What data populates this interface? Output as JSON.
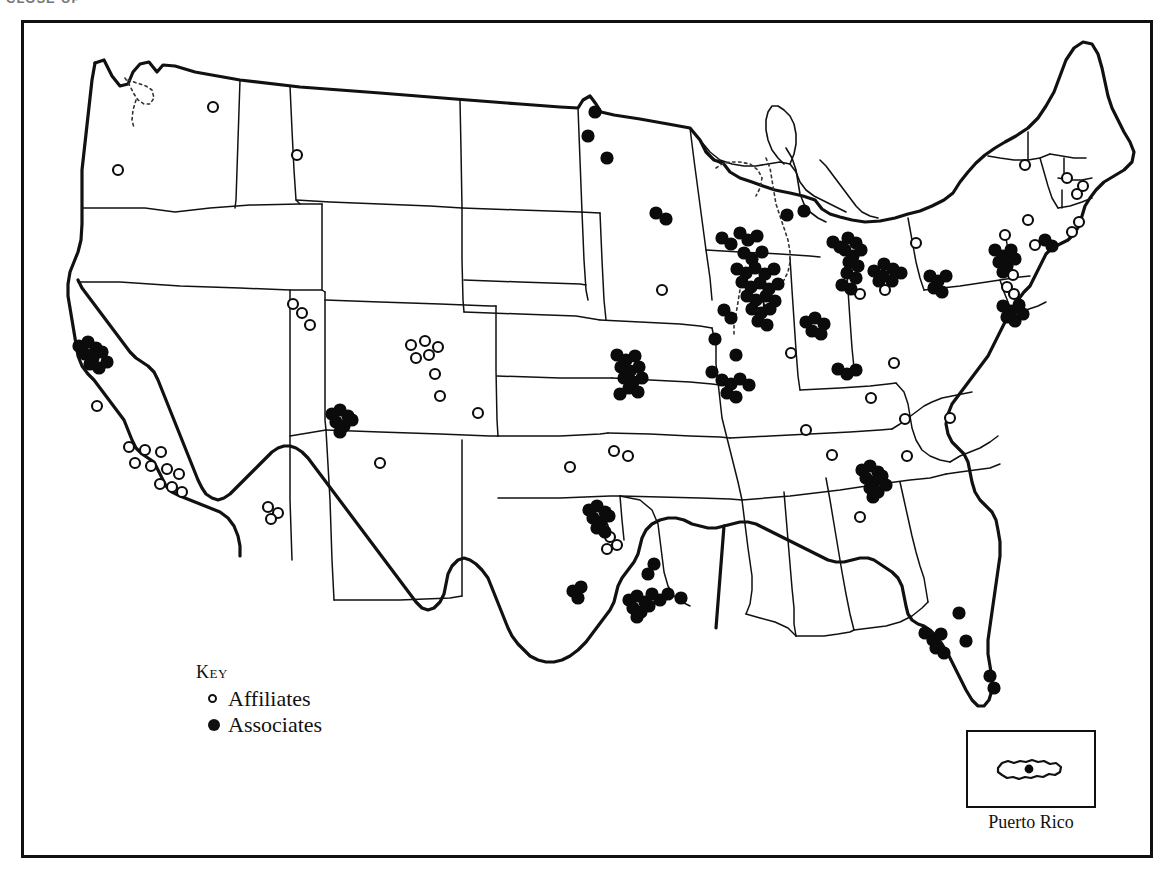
{
  "page": {
    "clipped_header_text": "CLOSE-UP",
    "background_color": "#ffffff",
    "ink_color": "#0b0b0b",
    "width": 1174,
    "height": 888
  },
  "key": {
    "title": "Key",
    "entries": [
      {
        "symbol": "open-circle",
        "label": "Affiliates"
      },
      {
        "symbol": "filled-circle",
        "label": "Associates"
      }
    ]
  },
  "inset": {
    "label": "Puerto Rico",
    "marker_symbol": "filled-circle"
  },
  "chart_data": {
    "type": "scatter",
    "title": "Key",
    "subtitle": "Distribution of Affiliates and Associates across the United States and Puerto Rico",
    "xlabel": "",
    "ylabel": "",
    "projection": "contiguous-united-states-outline",
    "grid": false,
    "legend_position": "lower-left",
    "series": [
      {
        "name": "Affiliates",
        "symbol": "open-circle",
        "color": "#ffffff",
        "stroke": "#0b0b0b",
        "count": 62,
        "points": [
          [
            213,
            107
          ],
          [
            297,
            155
          ],
          [
            118,
            170
          ],
          [
            293,
            304
          ],
          [
            302,
            313
          ],
          [
            310,
            325
          ],
          [
            411,
            345
          ],
          [
            425,
            341
          ],
          [
            438,
            347
          ],
          [
            416,
            358
          ],
          [
            429,
            355
          ],
          [
            435,
            374
          ],
          [
            440,
            396
          ],
          [
            380,
            463
          ],
          [
            268,
            507
          ],
          [
            278,
            513
          ],
          [
            271,
            519
          ],
          [
            478,
            413
          ],
          [
            570,
            467
          ],
          [
            614,
            451
          ],
          [
            628,
            456
          ],
          [
            97,
            406
          ],
          [
            129,
            447
          ],
          [
            145,
            450
          ],
          [
            161,
            452
          ],
          [
            135,
            463
          ],
          [
            151,
            466
          ],
          [
            167,
            469
          ],
          [
            179,
            474
          ],
          [
            160,
            484
          ],
          [
            172,
            487
          ],
          [
            182,
            492
          ],
          [
            662,
            290
          ],
          [
            759,
            305
          ],
          [
            791,
            353
          ],
          [
            860,
            294
          ],
          [
            885,
            290
          ],
          [
            894,
            363
          ],
          [
            871,
            398
          ],
          [
            806,
            430
          ],
          [
            832,
            455
          ],
          [
            860,
            517
          ],
          [
            905,
            419
          ],
          [
            907,
            456
          ],
          [
            950,
            418
          ],
          [
            916,
            243
          ],
          [
            1025,
            165
          ],
          [
            1028,
            220
          ],
          [
            1035,
            245
          ],
          [
            1005,
            235
          ],
          [
            1013,
            275
          ],
          [
            1007,
            287
          ],
          [
            1014,
            294
          ],
          [
            1067,
            178
          ],
          [
            1077,
            194
          ],
          [
            1083,
            186
          ],
          [
            1072,
            232
          ],
          [
            1079,
            222
          ],
          [
            603,
            527
          ],
          [
            610,
            537
          ],
          [
            617,
            545
          ],
          [
            607,
            549
          ]
        ]
      },
      {
        "name": "Associates",
        "symbol": "filled-circle",
        "color": "#0b0b0b",
        "count": 168,
        "points": [
          [
            595,
            112
          ],
          [
            588,
            136
          ],
          [
            607,
            158
          ],
          [
            656,
            213
          ],
          [
            666,
            219
          ],
          [
            722,
            238
          ],
          [
            731,
            244
          ],
          [
            740,
            233
          ],
          [
            748,
            240
          ],
          [
            757,
            236
          ],
          [
            744,
            253
          ],
          [
            752,
            259
          ],
          [
            762,
            252
          ],
          [
            737,
            269
          ],
          [
            746,
            273
          ],
          [
            755,
            268
          ],
          [
            765,
            274
          ],
          [
            774,
            269
          ],
          [
            742,
            282
          ],
          [
            751,
            287
          ],
          [
            760,
            283
          ],
          [
            769,
            289
          ],
          [
            778,
            284
          ],
          [
            747,
            296
          ],
          [
            756,
            300
          ],
          [
            766,
            296
          ],
          [
            775,
            301
          ],
          [
            752,
            309
          ],
          [
            761,
            313
          ],
          [
            770,
            309
          ],
          [
            758,
            321
          ],
          [
            767,
            325
          ],
          [
            724,
            310
          ],
          [
            731,
            318
          ],
          [
            715,
            339
          ],
          [
            736,
            355
          ],
          [
            712,
            372
          ],
          [
            722,
            380
          ],
          [
            731,
            384
          ],
          [
            740,
            379
          ],
          [
            749,
            385
          ],
          [
            727,
            393
          ],
          [
            736,
            397
          ],
          [
            787,
            215
          ],
          [
            804,
            211
          ],
          [
            806,
            322
          ],
          [
            815,
            318
          ],
          [
            824,
            324
          ],
          [
            812,
            331
          ],
          [
            821,
            334
          ],
          [
            848,
            238
          ],
          [
            856,
            243
          ],
          [
            845,
            250
          ],
          [
            853,
            256
          ],
          [
            861,
            250
          ],
          [
            849,
            262
          ],
          [
            858,
            266
          ],
          [
            847,
            273
          ],
          [
            856,
            278
          ],
          [
            842,
            285
          ],
          [
            851,
            289
          ],
          [
            833,
            242
          ],
          [
            840,
            247
          ],
          [
            884,
            264
          ],
          [
            893,
            269
          ],
          [
            883,
            276
          ],
          [
            892,
            281
          ],
          [
            901,
            273
          ],
          [
            874,
            271
          ],
          [
            879,
            281
          ],
          [
            838,
            369
          ],
          [
            847,
            374
          ],
          [
            856,
            370
          ],
          [
            617,
            355
          ],
          [
            626,
            360
          ],
          [
            635,
            356
          ],
          [
            621,
            367
          ],
          [
            630,
            371
          ],
          [
            639,
            367
          ],
          [
            624,
            378
          ],
          [
            633,
            382
          ],
          [
            642,
            378
          ],
          [
            629,
            388
          ],
          [
            638,
            392
          ],
          [
            620,
            394
          ],
          [
            79,
            346
          ],
          [
            88,
            342
          ],
          [
            96,
            348
          ],
          [
            85,
            354
          ],
          [
            93,
            358
          ],
          [
            102,
            352
          ],
          [
            90,
            364
          ],
          [
            99,
            368
          ],
          [
            107,
            362
          ],
          [
            332,
            414
          ],
          [
            340,
            410
          ],
          [
            348,
            416
          ],
          [
            336,
            422
          ],
          [
            344,
            426
          ],
          [
            352,
            420
          ],
          [
            340,
            432
          ],
          [
            930,
            276
          ],
          [
            938,
            281
          ],
          [
            946,
            276
          ],
          [
            934,
            288
          ],
          [
            942,
            292
          ],
          [
            1003,
            306
          ],
          [
            1011,
            311
          ],
          [
            1019,
            305
          ],
          [
            1007,
            317
          ],
          [
            1015,
            321
          ],
          [
            1023,
            314
          ],
          [
            862,
            470
          ],
          [
            870,
            466
          ],
          [
            878,
            472
          ],
          [
            866,
            478
          ],
          [
            874,
            482
          ],
          [
            882,
            476
          ],
          [
            870,
            488
          ],
          [
            878,
            492
          ],
          [
            886,
            485
          ],
          [
            873,
            497
          ],
          [
            925,
            633
          ],
          [
            933,
            640
          ],
          [
            941,
            634
          ],
          [
            936,
            648
          ],
          [
            944,
            653
          ],
          [
            959,
            613
          ],
          [
            966,
            641
          ],
          [
            990,
            676
          ],
          [
            994,
            688
          ],
          [
            589,
            510
          ],
          [
            597,
            506
          ],
          [
            605,
            512
          ],
          [
            593,
            518
          ],
          [
            601,
            522
          ],
          [
            609,
            516
          ],
          [
            597,
            528
          ],
          [
            605,
            532
          ],
          [
            573,
            591
          ],
          [
            581,
            587
          ],
          [
            578,
            598
          ],
          [
            629,
            600
          ],
          [
            637,
            596
          ],
          [
            645,
            602
          ],
          [
            633,
            608
          ],
          [
            641,
            612
          ],
          [
            649,
            606
          ],
          [
            637,
            617
          ],
          [
            652,
            594
          ],
          [
            660,
            600
          ],
          [
            668,
            594
          ],
          [
            681,
            598
          ],
          [
            654,
            564
          ],
          [
            648,
            574
          ],
          [
            995,
            250
          ],
          [
            1003,
            256
          ],
          [
            1011,
            250
          ],
          [
            999,
            262
          ],
          [
            1007,
            266
          ],
          [
            1015,
            259
          ],
          [
            1003,
            272
          ],
          [
            1045,
            240
          ],
          [
            1052,
            246
          ]
        ]
      }
    ]
  }
}
